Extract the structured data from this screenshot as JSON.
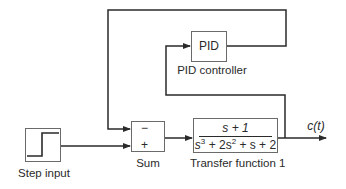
{
  "diagram": {
    "colors": {
      "wire": "#2a2a2a",
      "block_border": "#6a6a6a",
      "background": "#ffffff"
    },
    "blocks": {
      "step": {
        "label": "Step input",
        "icon": "step-signal-icon"
      },
      "sum": {
        "label": "Sum",
        "signs": [
          "−",
          "+"
        ]
      },
      "pid": {
        "text": "PID",
        "label": "PID controller"
      },
      "transfer_function": {
        "label": "Transfer function 1",
        "numerator": "s + 1",
        "denominator": {
          "t1_var": "s",
          "t1_exp": "3",
          "t2": " + 2s",
          "t2_exp": "2",
          "t3": " + s + 2"
        }
      }
    },
    "output": {
      "label": "c(t)"
    },
    "connections": [
      {
        "from": "Step input",
        "to": "Sum (+)"
      },
      {
        "from": "Sum",
        "to": "Transfer function 1"
      },
      {
        "from": "Transfer function 1",
        "to": "c(t)"
      },
      {
        "from": "c(t)",
        "to": "PID controller"
      },
      {
        "from": "PID controller",
        "to": "Sum (−)"
      }
    ]
  }
}
